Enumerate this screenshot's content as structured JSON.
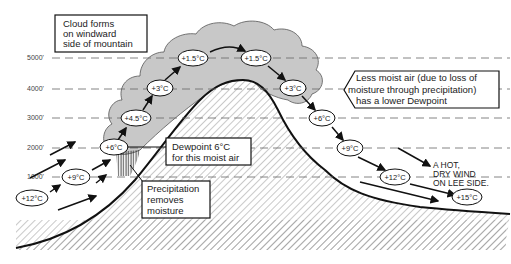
{
  "altitudes": [
    {
      "label": "5000'",
      "y": 58
    },
    {
      "label": "4000'",
      "y": 89
    },
    {
      "label": "3000'",
      "y": 118
    },
    {
      "label": "2000'",
      "y": 148
    },
    {
      "label": "1000'",
      "y": 177
    }
  ],
  "temperatures": [
    {
      "label": "+12°C",
      "x": 32,
      "y": 198
    },
    {
      "label": "+9°C",
      "x": 76,
      "y": 177
    },
    {
      "label": "+6°C",
      "x": 114,
      "y": 147
    },
    {
      "label": "+4.5°C",
      "x": 136,
      "y": 118
    },
    {
      "label": "+3°C",
      "x": 160,
      "y": 88
    },
    {
      "label": "+1.5°C",
      "x": 193,
      "y": 58
    },
    {
      "label": "+1.5°C",
      "x": 256,
      "y": 58
    },
    {
      "label": "+3°C",
      "x": 293,
      "y": 88
    },
    {
      "label": "+6°C",
      "x": 322,
      "y": 118
    },
    {
      "label": "+9°C",
      "x": 350,
      "y": 148
    },
    {
      "label": "+12°C",
      "x": 395,
      "y": 177
    },
    {
      "label": "+15°C",
      "x": 467,
      "y": 197
    }
  ],
  "notes": {
    "cloud": [
      "Cloud forms",
      "on windward",
      "side of mountain"
    ],
    "less_moist": [
      "Less moist air (due to loss of",
      "moisture through precipitation)",
      "has a lower Dewpoint"
    ],
    "dewpoint": [
      "Dewpoint 6°C",
      "for this moist air"
    ],
    "precipitation": [
      "Precipitation",
      "removes",
      "moisture"
    ],
    "hot_wind": [
      "A HOT,",
      "DRY WIND",
      "ON LEE SIDE."
    ]
  },
  "colors": {
    "cloud_fill": "#c8c8c8",
    "line": "#111111",
    "dash": "#666666",
    "hatch": "#777777"
  }
}
